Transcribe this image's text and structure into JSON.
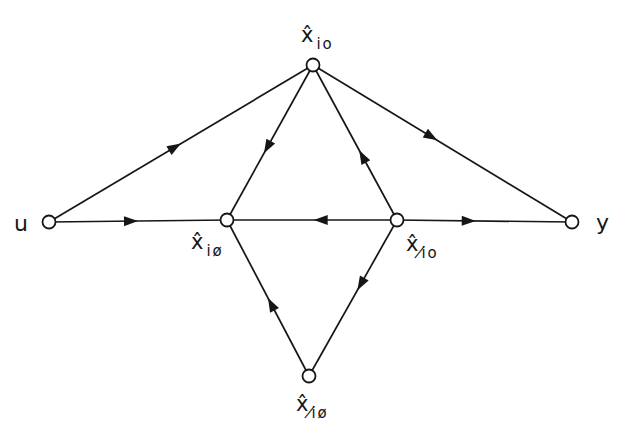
{
  "figure": {
    "background": "#ffffff",
    "ink": "#161616",
    "node_style": {
      "radius": 6.5,
      "fill": "#ffffff",
      "stroke_width": 1.8
    },
    "edge_style": {
      "stroke_width": 1.7,
      "arrow_length": 14,
      "arrow_half_width": 5
    },
    "nodes": [
      {
        "id": "u",
        "x": 49,
        "y": 222,
        "label": {
          "text": "u",
          "x": 14,
          "y": 231,
          "size": 22
        }
      },
      {
        "id": "x-io",
        "x": 313,
        "y": 65,
        "label": {
          "main": "x̂",
          "sub": "io",
          "x": 301,
          "y": 42,
          "size": 21,
          "sub_size": 15
        }
      },
      {
        "id": "x-i-oslash",
        "x": 227,
        "y": 220,
        "label": {
          "main": "x̂",
          "sub": "iø",
          "x": 191,
          "y": 249,
          "size": 21,
          "sub_size": 15
        }
      },
      {
        "id": "x-islash-o",
        "x": 397,
        "y": 220,
        "label": {
          "main": "x̂",
          "sub": "i̸o",
          "x": 406,
          "y": 251,
          "size": 21,
          "sub_size": 15
        }
      },
      {
        "id": "x-islash-oslash",
        "x": 309,
        "y": 376,
        "label": {
          "main": "x̂",
          "sub": "i̸ø",
          "x": 296,
          "y": 411,
          "size": 21,
          "sub_size": 15
        }
      },
      {
        "id": "y",
        "x": 572,
        "y": 222,
        "label": {
          "text": "y",
          "x": 596,
          "y": 230,
          "size": 22
        }
      }
    ],
    "edges": [
      {
        "from": "u",
        "to": "x-io",
        "arrow_t": 0.5
      },
      {
        "from": "u",
        "to": "x-i-oslash",
        "arrow_t": 0.5
      },
      {
        "from": "x-io",
        "to": "x-i-oslash",
        "arrow_t": 0.57
      },
      {
        "from": "x-islash-o",
        "to": "x-io",
        "arrow_t": 0.45
      },
      {
        "from": "x-io",
        "to": "y",
        "arrow_t": 0.48
      },
      {
        "from": "x-islash-o",
        "to": "x-i-oslash",
        "arrow_t": 0.49
      },
      {
        "from": "x-islash-o",
        "to": "y",
        "arrow_t": 0.45
      },
      {
        "from": "x-islash-oslash",
        "to": "x-i-oslash",
        "arrow_t": 0.5
      },
      {
        "from": "x-islash-o",
        "to": "x-islash-oslash",
        "arrow_t": 0.45
      }
    ]
  }
}
